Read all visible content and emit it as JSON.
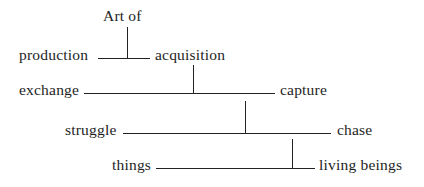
{
  "diagram": {
    "type": "binary division tree (dichotomy)",
    "root": {
      "label": "Art of"
    },
    "levels": [
      {
        "left": "production",
        "right": "acquisition",
        "parent": "Art of"
      },
      {
        "left": "exchange",
        "right": "capture",
        "parent": "acquisition"
      },
      {
        "left": "struggle",
        "right": "chase",
        "parent": "capture"
      },
      {
        "left": "things",
        "right": "living beings",
        "parent": "chase"
      }
    ],
    "line_color": "#222222",
    "text_color": "#1e1e1e"
  }
}
